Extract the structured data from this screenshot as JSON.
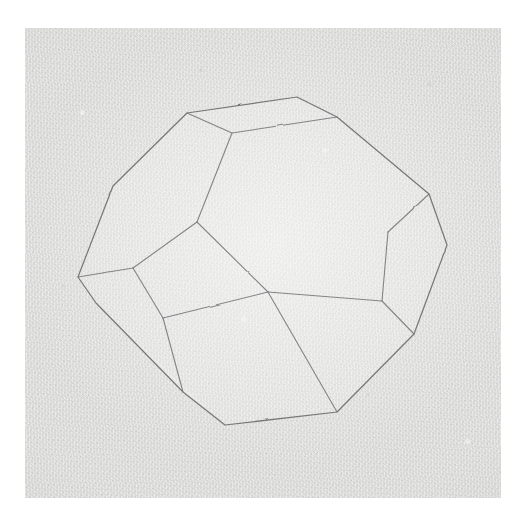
{
  "artwork": {
    "title": "Truncated octahedron pencil drawing",
    "medium": "graphite on textured paper",
    "subject": "truncated-octahedron",
    "alt_text": "Line drawing of a truncated octahedron (polyhedron) rendered in light pencil on grainy grey paper."
  },
  "canvas": {
    "width": 527,
    "height": 515,
    "background_color": "#ffffff"
  },
  "paper": {
    "x": 25,
    "y": 28,
    "width": 476,
    "height": 470,
    "base_color": "#e6e6e4",
    "texture": "grainy-laid-paper"
  },
  "stroke": {
    "color": "#6f6f72",
    "inner_color": "#7c7c80",
    "width": 1.25,
    "face_fill": "rgba(255,255,255,0.13)"
  },
  "chart_data": {
    "type": "diagram",
    "vertices": {
      "top_face": [
        [
          187,
          113
        ],
        [
          232,
          133
        ],
        [
          337,
          117
        ],
        [
          297,
          97
        ]
      ],
      "silhouette": [
        [
          187,
          113
        ],
        [
          113,
          186
        ],
        [
          78,
          277
        ],
        [
          96,
          303
        ],
        [
          183,
          392
        ],
        [
          225,
          425
        ],
        [
          337,
          412
        ],
        [
          414,
          334
        ],
        [
          447,
          245
        ],
        [
          429,
          194
        ],
        [
          337,
          117
        ],
        [
          297,
          97
        ]
      ],
      "center_quad": [
        [
          197,
          222
        ],
        [
          268,
          292
        ],
        [
          163,
          318
        ],
        [
          133,
          268
        ]
      ],
      "right_facet": [
        [
          429,
          194
        ],
        [
          447,
          245
        ],
        [
          414,
          334
        ],
        [
          382,
          301
        ],
        [
          388,
          232
        ]
      ],
      "lower_left_facet": [
        [
          113,
          186
        ],
        [
          78,
          277
        ],
        [
          96,
          303
        ],
        [
          183,
          392
        ],
        [
          160,
          318
        ],
        [
          133,
          268
        ]
      ],
      "bottom_left_facet": [
        [
          96,
          303
        ],
        [
          183,
          392
        ],
        [
          225,
          425
        ]
      ]
    },
    "edges": [
      [
        [
          187,
          113
        ],
        [
          232,
          133
        ]
      ],
      [
        [
          232,
          133
        ],
        [
          337,
          117
        ]
      ],
      [
        [
          337,
          117
        ],
        [
          297,
          97
        ]
      ],
      [
        [
          297,
          97
        ],
        [
          187,
          113
        ]
      ],
      [
        [
          187,
          113
        ],
        [
          113,
          186
        ]
      ],
      [
        [
          113,
          186
        ],
        [
          78,
          277
        ]
      ],
      [
        [
          78,
          277
        ],
        [
          96,
          303
        ]
      ],
      [
        [
          96,
          303
        ],
        [
          183,
          392
        ]
      ],
      [
        [
          183,
          392
        ],
        [
          225,
          425
        ]
      ],
      [
        [
          225,
          425
        ],
        [
          337,
          412
        ]
      ],
      [
        [
          337,
          412
        ],
        [
          414,
          334
        ]
      ],
      [
        [
          414,
          334
        ],
        [
          447,
          245
        ]
      ],
      [
        [
          447,
          245
        ],
        [
          429,
          194
        ]
      ],
      [
        [
          429,
          194
        ],
        [
          337,
          117
        ]
      ],
      [
        [
          232,
          133
        ],
        [
          197,
          222
        ]
      ],
      [
        [
          197,
          222
        ],
        [
          268,
          292
        ]
      ],
      [
        [
          268,
          292
        ],
        [
          133,
          268
        ]
      ],
      [
        [
          133,
          268
        ],
        [
          197,
          222
        ]
      ],
      [
        [
          133,
          268
        ],
        [
          78,
          277
        ]
      ],
      [
        [
          163,
          318
        ],
        [
          183,
          392
        ]
      ],
      [
        [
          268,
          292
        ],
        [
          337,
          412
        ]
      ],
      [
        [
          429,
          194
        ],
        [
          388,
          232
        ]
      ],
      [
        [
          388,
          232
        ],
        [
          382,
          301
        ]
      ],
      [
        [
          382,
          301
        ],
        [
          414,
          334
        ]
      ],
      [
        [
          382,
          301
        ],
        [
          268,
          292
        ]
      ]
    ],
    "face_count": 14
  }
}
